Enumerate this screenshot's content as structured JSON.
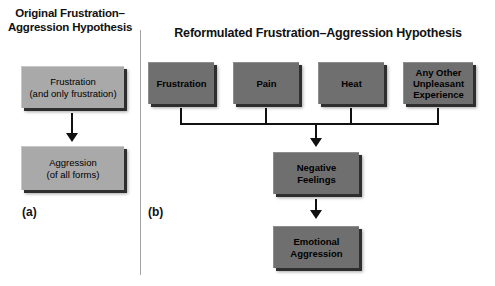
{
  "figure": {
    "panels": [
      {
        "letter": "(a)",
        "title": "Original Frustration–\nAggression Hypothesis",
        "title_line1": "Original Frustration–",
        "title_line2": "Aggression Hypothesis",
        "nodes": [
          {
            "id": "frustration-only",
            "line1": "Frustration",
            "line2": "(and only frustration)"
          },
          {
            "id": "aggression-all",
            "line1": "Aggression",
            "line2": "(of all forms)"
          }
        ]
      },
      {
        "letter": "(b)",
        "title": "Reformulated Frustration–Aggression Hypothesis",
        "nodes": [
          {
            "id": "frustration",
            "line1": "Frustration"
          },
          {
            "id": "pain",
            "line1": "Pain"
          },
          {
            "id": "heat",
            "line1": "Heat"
          },
          {
            "id": "any-other",
            "line1": "Any Other",
            "line2": "Unpleasant",
            "line3": "Experience"
          },
          {
            "id": "negative-feelings",
            "line1": "Negative",
            "line2": "Feelings"
          },
          {
            "id": "emotional-aggression",
            "line1": "Emotional",
            "line2": "Aggression"
          }
        ]
      }
    ],
    "colors": {
      "box_light": "#a9a9a9",
      "box_dark": "#6f6f6f",
      "shadow": "#2e2e2e",
      "connector": "#111111",
      "divider": "#a2a2a2",
      "background": "#ffffff",
      "text": "#000000"
    }
  }
}
